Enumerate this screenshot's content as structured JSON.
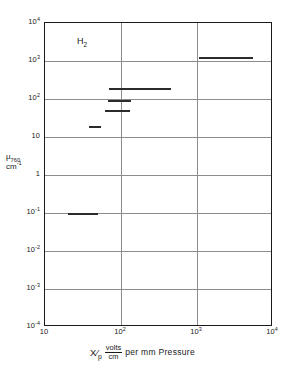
{
  "figure": {
    "gas_annotation": "H",
    "gas_annotation_sub": "2"
  },
  "axes": {
    "y": {
      "label_line1_mu": "μ",
      "label_line1_sub": "760",
      "label_line2_base": "cm",
      "label_line2_sup": "-1",
      "ticks": [
        {
          "value": 10000,
          "mantissa": "10",
          "exponent": "4"
        },
        {
          "value": 1000,
          "mantissa": "10",
          "exponent": "3"
        },
        {
          "value": 100,
          "mantissa": "10",
          "exponent": "2"
        },
        {
          "value": 10,
          "mantissa": "10",
          "exponent": ""
        },
        {
          "value": 1,
          "mantissa": "1",
          "exponent": ""
        },
        {
          "value": 0.1,
          "mantissa": "10",
          "exponent": "-1"
        },
        {
          "value": 0.01,
          "mantissa": "10",
          "exponent": "-2"
        },
        {
          "value": 0.001,
          "mantissa": "10",
          "exponent": "-3"
        },
        {
          "value": 0.0001,
          "mantissa": "10",
          "exponent": "-4"
        }
      ]
    },
    "x": {
      "label_var": "X",
      "label_var_den": "p",
      "label_frac_num": "volts",
      "label_frac_den": "cm",
      "label_rest": "per mm Pressure",
      "ticks": [
        {
          "value": 10,
          "mantissa": "10",
          "exponent": ""
        },
        {
          "value": 100,
          "mantissa": "10",
          "exponent": "2"
        },
        {
          "value": 1000,
          "mantissa": "10",
          "exponent": "3"
        },
        {
          "value": 10000,
          "mantissa": "10",
          "exponent": "4"
        }
      ]
    }
  },
  "chart_data": {
    "type": "line",
    "title": "",
    "subtitle": "",
    "annotation": "H2",
    "xlabel": "X/p volts/cm per mm Pressure",
    "ylabel": "mu_760 cm^-1",
    "xscale": "log",
    "yscale": "log",
    "xlim": [
      10,
      10000
    ],
    "ylim": [
      0.0001,
      10000
    ],
    "grid": true,
    "legend": null,
    "x_ticks": [
      10,
      100,
      1000,
      10000
    ],
    "y_ticks": [
      0.0001,
      0.001,
      0.01,
      0.1,
      1,
      10,
      100,
      1000,
      10000
    ],
    "series": [
      {
        "name": "segment-1",
        "y": 0.1,
        "x_start": 20,
        "x_end": 50
      },
      {
        "name": "segment-2",
        "y": 19,
        "x_start": 38,
        "x_end": 55
      },
      {
        "name": "segment-3",
        "y": 50,
        "x_start": 62,
        "x_end": 130
      },
      {
        "name": "segment-4",
        "y": 95,
        "x_start": 68,
        "x_end": 135
      },
      {
        "name": "segment-5",
        "y": 200,
        "x_start": 70,
        "x_end": 450
      },
      {
        "name": "segment-6",
        "y": 1300,
        "x_start": 1050,
        "x_end": 5500
      }
    ]
  }
}
